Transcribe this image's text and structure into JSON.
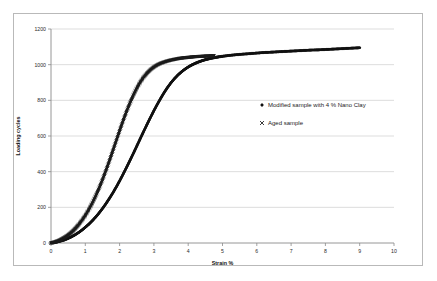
{
  "chart_data": {
    "type": "scatter",
    "title": "",
    "xlabel": "Strain %",
    "ylabel": "Loading cycles",
    "xlim": [
      0,
      10
    ],
    "ylim": [
      0,
      1200
    ],
    "xticks": [
      "0",
      "1",
      "2",
      "3",
      "4",
      "5",
      "6",
      "7",
      "8",
      "9",
      "10"
    ],
    "yticks": [
      "0",
      "200",
      "400",
      "600",
      "800",
      "1000",
      "1200"
    ],
    "grid": "horizontal",
    "legend_position": "center-right-inside",
    "series": [
      {
        "name": "Modified sample with 4 % Nano Clay",
        "marker": "diamond",
        "color": "#111111",
        "x": [
          0.0,
          0.1,
          0.2,
          0.3,
          0.4,
          0.5,
          0.6,
          0.7,
          0.8,
          0.9,
          1.0,
          1.1,
          1.2,
          1.3,
          1.4,
          1.5,
          1.6,
          1.7,
          1.8,
          1.9,
          2.0,
          2.1,
          2.2,
          2.3,
          2.4,
          2.5,
          2.6,
          2.7,
          2.8,
          2.9,
          3.0,
          3.1,
          3.2,
          3.3,
          3.4,
          3.5,
          3.6,
          3.7,
          3.8,
          3.9,
          4.0,
          4.1,
          4.2,
          4.3,
          4.4,
          4.5,
          4.6,
          4.7,
          4.8,
          4.9,
          5.0,
          5.2,
          5.4,
          5.6,
          5.8,
          6.0,
          6.2,
          6.4,
          6.6,
          6.8,
          7.0,
          7.2,
          7.4,
          7.6,
          7.8,
          8.0,
          8.2,
          8.4,
          8.6,
          8.8,
          9.0
        ],
        "y": [
          0,
          3,
          7,
          12,
          18,
          26,
          35,
          46,
          58,
          72,
          88,
          105,
          124,
          145,
          168,
          193,
          220,
          249,
          280,
          313,
          348,
          385,
          423,
          462,
          502,
          543,
          584,
          625,
          665,
          704,
          742,
          778,
          812,
          844,
          873,
          899,
          922,
          942,
          959,
          974,
          987,
          998,
          1007,
          1015,
          1022,
          1028,
          1033,
          1037,
          1041,
          1044,
          1047,
          1052,
          1056,
          1059,
          1062,
          1065,
          1068,
          1070,
          1072,
          1074,
          1076,
          1078,
          1080,
          1082,
          1083,
          1085,
          1087,
          1089,
          1091,
          1093,
          1095
        ]
      },
      {
        "name": "Aged sample",
        "marker": "cross",
        "color": "#1a1a1a",
        "x": [
          0.0,
          0.08,
          0.16,
          0.24,
          0.32,
          0.4,
          0.48,
          0.56,
          0.64,
          0.72,
          0.8,
          0.9,
          1.0,
          1.1,
          1.2,
          1.3,
          1.4,
          1.5,
          1.6,
          1.7,
          1.8,
          1.9,
          2.0,
          2.1,
          2.2,
          2.3,
          2.4,
          2.5,
          2.6,
          2.7,
          2.8,
          2.9,
          3.0,
          3.1,
          3.2,
          3.3,
          3.4,
          3.5,
          3.6,
          3.7,
          3.8,
          3.9,
          4.0,
          4.1,
          4.2,
          4.3,
          4.4,
          4.5,
          4.6,
          4.7,
          4.75
        ],
        "y": [
          0,
          4,
          9,
          15,
          23,
          32,
          42,
          54,
          68,
          84,
          102,
          127,
          155,
          187,
          223,
          263,
          307,
          355,
          406,
          460,
          516,
          573,
          630,
          685,
          737,
          785,
          829,
          868,
          902,
          930,
          953,
          972,
          987,
          999,
          1008,
          1015,
          1021,
          1026,
          1030,
          1034,
          1037,
          1039,
          1041,
          1043,
          1045,
          1046,
          1047,
          1048,
          1049,
          1050,
          1050
        ]
      }
    ],
    "legend_entries": [
      {
        "label": "Modified sample with 4 % Nano Clay",
        "marker": "diamond"
      },
      {
        "label": "Aged sample",
        "marker": "cross"
      }
    ]
  }
}
